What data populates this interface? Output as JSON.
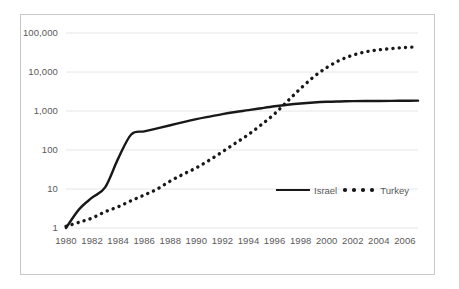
{
  "chart_data": {
    "type": "line",
    "title": "",
    "subtitle": "",
    "xlabel": "",
    "ylabel": "",
    "yscale": "log",
    "ylim": [
      1,
      100000
    ],
    "xlim": [
      1980,
      2007
    ],
    "grid": true,
    "grid_axis": "y",
    "legend_position": "bottom-right",
    "y_tick_labels": [
      "100,000",
      "10,000",
      "1,000",
      "100",
      "10",
      "1"
    ],
    "y_tick_values": [
      100000,
      10000,
      1000,
      100,
      10,
      1
    ],
    "x_tick_labels": [
      "1980",
      "1982",
      "1984",
      "1986",
      "1988",
      "1990",
      "1992",
      "1994",
      "1996",
      "1998",
      "2000",
      "2002",
      "2004",
      "2006"
    ],
    "x_tick_values": [
      1980,
      1982,
      1984,
      1986,
      1988,
      1990,
      1992,
      1994,
      1996,
      1998,
      2000,
      2002,
      2004,
      2006
    ],
    "x": [
      1980,
      1981,
      1982,
      1983,
      1984,
      1985,
      1986,
      1987,
      1988,
      1989,
      1990,
      1991,
      1992,
      1993,
      1994,
      1995,
      1996,
      1997,
      1998,
      1999,
      2000,
      2001,
      2002,
      2003,
      2004,
      2005,
      2006,
      2007
    ],
    "series": [
      {
        "name": "Israel",
        "style": "solid",
        "color": "#181818",
        "values": [
          1,
          3,
          6,
          11,
          60,
          250,
          300,
          360,
          430,
          520,
          620,
          720,
          830,
          940,
          1050,
          1180,
          1320,
          1450,
          1560,
          1650,
          1720,
          1760,
          1790,
          1800,
          1810,
          1820,
          1830,
          1840
        ]
      },
      {
        "name": "Turkey",
        "style": "dotted",
        "color": "#181818",
        "values": [
          1.1,
          1.4,
          1.8,
          2.6,
          3.5,
          5,
          7,
          10,
          16,
          24,
          35,
          55,
          90,
          150,
          250,
          450,
          850,
          1800,
          3800,
          7500,
          13000,
          20000,
          27000,
          33000,
          37000,
          40000,
          42500,
          44000
        ]
      }
    ]
  },
  "legend": {
    "items": [
      {
        "label": "Israel",
        "style": "solid"
      },
      {
        "label": "Turkey",
        "style": "dotted"
      }
    ]
  }
}
